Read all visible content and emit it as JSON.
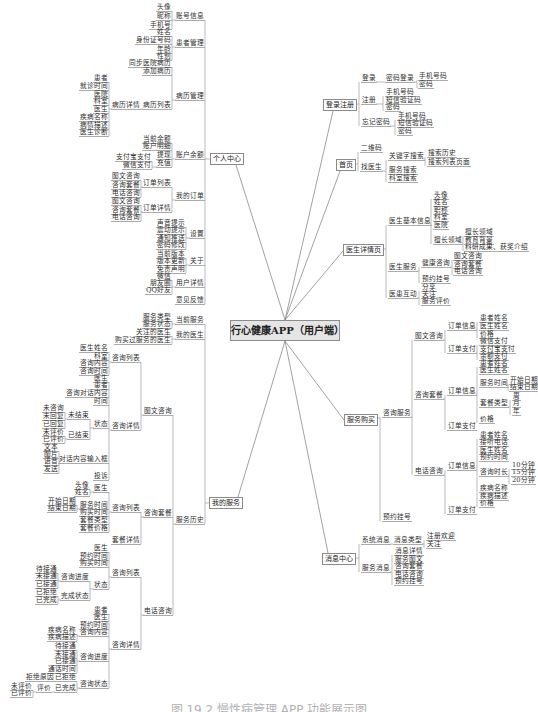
{
  "title": "行心健康APP（用户端）",
  "caption": "图 19.2  慢性病管理 APP 功能展示图",
  "personal_center": {
    "label": "个人中心",
    "account_info": {
      "label": "账号信息",
      "items": [
        "头像",
        "昵称",
        "手机号"
      ]
    },
    "patient_management": {
      "label": "患者管理",
      "items": [
        "姓名",
        "身份证号码",
        "年龄",
        "性别"
      ]
    },
    "record_management": {
      "label": "病历管理",
      "items": [
        "同步医院病历",
        "添加病历"
      ],
      "record_list": {
        "label": "病历列表",
        "record_detail": {
          "label": "病历详情",
          "items": [
            "患者",
            "就诊时间",
            "医院",
            "科室",
            "医生",
            "疾病名称",
            "病情描述",
            "医生诊断"
          ]
        }
      }
    },
    "account_balance": {
      "label": "账户余额",
      "items": [
        "当前余额",
        "账户明细",
        "提现",
        "充值"
      ],
      "payment_methods": [
        "支付宝支付",
        "微信支付"
      ]
    },
    "my_orders": {
      "label": "我的订单",
      "order_list": {
        "label": "订单列表",
        "items": [
          "图文咨询",
          "咨询套餐",
          "电话咨询"
        ]
      },
      "order_detail": {
        "label": "订单详情",
        "items": [
          "图文咨询",
          "咨询套餐",
          "电话咨询"
        ]
      }
    },
    "settings": {
      "label": "设置",
      "items": [
        "声音提示",
        "震动提示",
        "通知推送",
        "密码修改"
      ]
    },
    "about": {
      "label": "关于",
      "items": [
        "当前版本",
        "版本更新",
        "免责声明"
      ]
    },
    "user_detail": {
      "label": "用户详情",
      "items": [
        "微信",
        "朋友圈",
        "QQ好友"
      ]
    },
    "feedback": {
      "label": "意见反馈"
    }
  },
  "my_services": {
    "label": "我的服务",
    "current_service": {
      "label": "当前服务",
      "items": [
        "服务类型",
        "服务状态"
      ]
    },
    "my_doctors": {
      "label": "我的医生",
      "items": [
        "关注的医生",
        "购买过服务的医生"
      ]
    },
    "service_history": {
      "label": "服务历史",
      "text_consult": {
        "label": "图文咨询",
        "consult_list": {
          "label": "咨询列表",
          "items": [
            "医生姓名",
            "科室",
            "咨询内容",
            "咨询时间"
          ]
        },
        "consult_detail": {
          "label": "咨询详情",
          "items": [
            "医生",
            "患者",
            "咨询对话内容",
            "时间"
          ],
          "status": {
            "label": "状态",
            "unfinished": {
              "label": "未结束",
              "items": [
                "未咨询",
                "未回复",
                "已回复"
              ]
            },
            "finished": {
              "label": "已结束",
              "items": [
                "未评价",
                "已评价"
              ]
            }
          },
          "input_box": {
            "label": "对话内容输入框",
            "items": [
              "文本",
              "图片",
              "语音",
              "发送"
            ]
          },
          "complaint": "投诉"
        }
      },
      "package_consult": {
        "label": "咨询套餐",
        "consult_list": {
          "label": "咨询列表",
          "doctor": {
            "label": "医生",
            "items": [
              "头像",
              "姓名"
            ]
          },
          "service_time": {
            "label": "服务时间",
            "items": [
              "开始日期",
              "结束日期"
            ]
          },
          "items": [
            "购买时间",
            "套餐类型",
            "套餐价格"
          ]
        },
        "package_detail": {
          "label": "套餐详情"
        }
      },
      "phone_consult": {
        "label": "电话咨询",
        "consult_list": {
          "label": "咨询列表",
          "items": [
            "医生",
            "预约时间",
            "购买时间"
          ],
          "status": {
            "label": "状态",
            "progress": {
              "label": "咨询进度",
              "items": [
                "待接通",
                "未接通",
                "已接通"
              ]
            },
            "completion": {
              "label": "完成状态",
              "items": [
                "已拒绝",
                "已完成"
              ]
            }
          }
        },
        "consult_detail": {
          "label": "咨询详情",
          "items": [
            "患者",
            "医生",
            "预约时间"
          ],
          "content": {
            "label": "咨询内容",
            "items": [
              "疾病名称",
              "疾病描述"
            ]
          },
          "progress": {
            "label": "咨询进度",
            "items": [
              "待接通",
              "未接通",
              "已接通",
              "通话时间"
            ]
          },
          "state": {
            "label": "咨询状态",
            "rejected": {
              "label": "已拒绝",
              "reason": "拒绝原因"
            },
            "completed": {
              "label": "已完成",
              "rating": {
                "label": "评价",
                "items": [
                  "未评价",
                  "已评价"
                ]
              }
            }
          }
        }
      }
    }
  },
  "login_register": {
    "label": "登录注册",
    "login": {
      "label": "登录",
      "password_login": {
        "label": "密码登录",
        "items": [
          "手机号码",
          "密码"
        ]
      }
    },
    "register": {
      "label": "注册",
      "items": [
        "手机号码",
        "短信验证码",
        "密码"
      ]
    },
    "forgot_password": {
      "label": "忘记密码",
      "items": [
        "手机号码",
        "短信验证码",
        "密码"
      ]
    }
  },
  "home": {
    "label": "首页",
    "qr_code": "二维码",
    "find_doctor": {
      "label": "找医生",
      "keyword_search": {
        "label": "关键字搜索",
        "items": [
          "搜索历史",
          "搜索列表页面"
        ]
      },
      "items": [
        "服务搜索",
        "科室搜索"
      ]
    }
  },
  "doctor_detail": {
    "label": "医生详情页",
    "basic_info": {
      "label": "医生基本信息",
      "items": [
        "头像",
        "姓名",
        "职称",
        "科室",
        "医院"
      ],
      "expertise": {
        "label": "擅长领域",
        "items": [
          "擅长领域",
          "教育背景",
          "科研成果、获奖介绍"
        ]
      }
    },
    "doctor_service": {
      "label": "医生服务",
      "health_consult": {
        "label": "健康咨询",
        "items": [
          "图文咨询",
          "咨询套餐",
          "电话咨询"
        ]
      },
      "appointment": "预约挂号"
    },
    "interaction": {
      "label": "医患互动",
      "items": [
        "分享",
        "关注",
        "服务评价"
      ]
    }
  },
  "service_purchase": {
    "label": "服务购买",
    "consult_service": {
      "label": "咨询服务",
      "text_consult": {
        "label": "图文咨询",
        "order_info": {
          "label": "订单信息",
          "items": [
            "患者姓名",
            "医生姓名",
            "价格"
          ]
        },
        "order_payment": {
          "label": "订单支付",
          "items": [
            "微信支付",
            "支付宝支付",
            "余额支付"
          ]
        }
      },
      "package_consult": {
        "label": "咨询套餐",
        "order_info": {
          "label": "订单信息",
          "items": [
            "患者姓名",
            "医生姓名"
          ],
          "service_time": {
            "label": "服务时间",
            "items": [
              "开始日期",
              "结束日期"
            ]
          },
          "package_type": {
            "label": "套餐类型",
            "items": [
              "周",
              "月",
              "年"
            ]
          },
          "price": "价格"
        },
        "order_payment": {
          "label": "订单支付"
        }
      },
      "phone_consult": {
        "label": "电话咨询",
        "order_info": {
          "label": "订单信息",
          "items": [
            "患者姓名",
            "接听电话",
            "医生姓名",
            "预约时间"
          ],
          "duration": {
            "label": "咨询时长",
            "items": [
              "10分钟",
              "15分钟",
              "20分钟"
            ]
          },
          "items_after": [
            "疾病名称",
            "疾病描述",
            "价格"
          ]
        },
        "order_payment": {
          "label": "订单支付"
        }
      }
    },
    "appointment": "预约挂号"
  },
  "message_center": {
    "label": "消息中心",
    "system_messages": {
      "label": "系统消息",
      "message_type": {
        "label": "消息类型",
        "items": [
          "注册欢迎",
          "关注"
        ]
      }
    },
    "service_messages": {
      "label": "服务消息",
      "items": [
        "消息详情",
        "服务图文",
        "咨询套餐",
        "电话咨询",
        "预约挂号"
      ]
    }
  }
}
